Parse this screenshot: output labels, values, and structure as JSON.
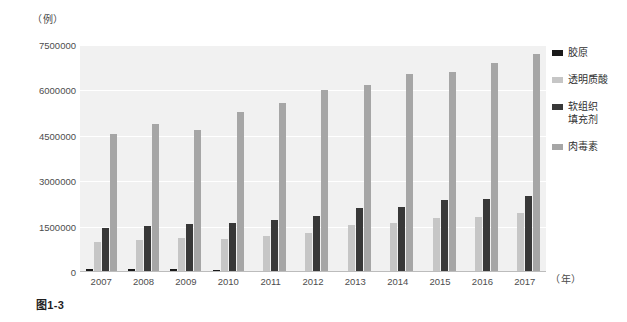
{
  "figure": {
    "caption": "图1-3",
    "y_unit_label": "（例）",
    "x_unit_label": "（年）"
  },
  "colors": {
    "collagen": "#1a1a1a",
    "hyaluronic_acid": "#c6c6c6",
    "soft_tissue_filler": "#383838",
    "botulinum_toxin": "#a6a6a6",
    "plot_background": "#f1f1f1",
    "gridline": "#ffffff"
  },
  "legend": {
    "position": "right",
    "items": [
      {
        "label": "胶原",
        "color": "#1a1a1a"
      },
      {
        "label": "透明质酸",
        "color": "#c6c6c6"
      },
      {
        "label": "软组织\n填充剂",
        "color": "#383838"
      },
      {
        "label": "肉毒素",
        "color": "#a6a6a6"
      }
    ]
  },
  "chart_data": {
    "type": "bar",
    "title": "",
    "subtitle": "",
    "xlabel": "（年）",
    "ylabel": "（例）",
    "grid": true,
    "ylim": [
      0,
      7500000
    ],
    "yticks": [
      0,
      1500000,
      3000000,
      4500000,
      6000000,
      7500000
    ],
    "ytick_labels": [
      "0",
      "1500000",
      "3000000",
      "4500000",
      "6000000",
      "7500000"
    ],
    "categories": [
      "2007",
      "2008",
      "2009",
      "2010",
      "2011",
      "2012",
      "2013",
      "2014",
      "2015",
      "2016",
      "2017"
    ],
    "series": [
      {
        "name": "胶原",
        "color": "#1a1a1a",
        "values": [
          100000,
          95000,
          85000,
          80000,
          45000,
          40000,
          35000,
          28000,
          22000,
          18000,
          15000
        ]
      },
      {
        "name": "透明质酸",
        "color": "#c6c6c6",
        "values": [
          1000000,
          1050000,
          1120000,
          1080000,
          1180000,
          1280000,
          1540000,
          1620000,
          1800000,
          1830000,
          1950000
        ]
      },
      {
        "name": "软组织填充剂",
        "color": "#383838",
        "values": [
          1450000,
          1510000,
          1600000,
          1630000,
          1720000,
          1860000,
          2120000,
          2160000,
          2390000,
          2420000,
          2510000
        ]
      },
      {
        "name": "肉毒素",
        "color": "#a6a6a6",
        "values": [
          4550000,
          4880000,
          4700000,
          5300000,
          5580000,
          6020000,
          6180000,
          6550000,
          6600000,
          6900000,
          7200000
        ]
      }
    ]
  }
}
